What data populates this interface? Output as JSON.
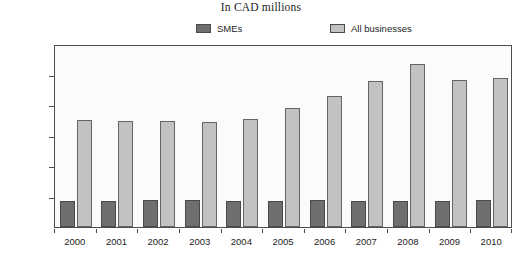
{
  "chart_data": {
    "type": "bar",
    "title": "In CAD millions",
    "xlabel": "",
    "ylabel": "",
    "ylim": [
      0,
      600000
    ],
    "ytick_values": [
      0,
      100000,
      200000,
      300000,
      400000,
      500000,
      600000
    ],
    "ytick_labels": [
      "0",
      "100 000",
      "200 000",
      "300 000",
      "400 000",
      "500 000",
      "600 000"
    ],
    "grid": false,
    "legend_position": "top",
    "categories": [
      "2000",
      "2001",
      "2002",
      "2003",
      "2004",
      "2005",
      "2006",
      "2007",
      "2008",
      "2009",
      "2010"
    ],
    "series": [
      {
        "name": "SMEs",
        "color": "#6f6f6f",
        "values": [
          86000,
          86000,
          88000,
          87000,
          85000,
          86000,
          87000,
          86000,
          86000,
          86000,
          87000
        ]
      },
      {
        "name": "All businesses",
        "color": "#c2c2c2",
        "values": [
          350000,
          348000,
          348000,
          344000,
          353000,
          391000,
          428000,
          478000,
          533000,
          482000,
          488000
        ]
      }
    ]
  },
  "axis": {
    "frame_color": "#4d4d4d",
    "plot_background": "#fbfbfb"
  }
}
